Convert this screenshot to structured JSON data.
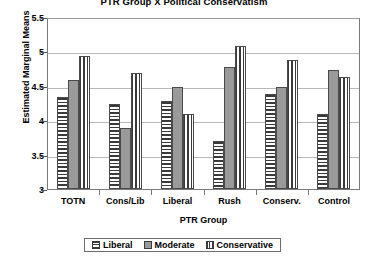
{
  "chart_data": {
    "type": "bar",
    "title": "PTR Group X Political Conservatism",
    "xlabel": "PTR Group",
    "ylabel": "Estimated Marginal Means",
    "categories": [
      "TOTN",
      "Cons/Lib",
      "Liberal",
      "Rush",
      "Conserv.",
      "Control"
    ],
    "series": [
      {
        "name": "Liberal",
        "values": [
          4.35,
          4.25,
          4.3,
          3.7,
          4.4,
          4.1
        ]
      },
      {
        "name": "Moderate",
        "values": [
          4.6,
          3.9,
          4.5,
          4.8,
          4.5,
          4.75
        ]
      },
      {
        "name": "Conservative",
        "values": [
          4.95,
          4.7,
          4.1,
          5.1,
          4.9,
          4.65
        ]
      }
    ],
    "ylim": [
      3,
      5.5
    ],
    "yticks": [
      "3",
      "3.5",
      "4",
      "4.5",
      "5",
      "5.5"
    ],
    "ytick_values": [
      3,
      3.5,
      4,
      4.5,
      5,
      5.5
    ],
    "grid": true,
    "legend_position": "bottom",
    "legend_title": "PTR Group"
  },
  "legend": {
    "items": [
      {
        "label": "Liberal",
        "pattern": "horizontal-stripes"
      },
      {
        "label": "Moderate",
        "pattern": "solid-gray"
      },
      {
        "label": "Conservative",
        "pattern": "vertical-stripes"
      }
    ]
  },
  "colors": {
    "moderate_fill": "#9a9a9a",
    "stripe": "#3a3a3a",
    "gridline": "#b9b9b9",
    "axis": "#7a7a7a",
    "background": "#ffffff"
  }
}
